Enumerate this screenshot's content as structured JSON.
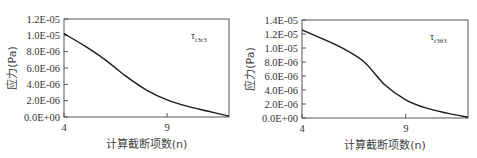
{
  "chart_data": [
    {
      "type": "line",
      "title": "",
      "legend_label": "τr3r3",
      "legend_symbol": "τ",
      "legend_subscript": "r3r3",
      "xlabel": "计算截断项数(n)",
      "ylabel": "应力(Pa)",
      "xlim": [
        4,
        12
      ],
      "ylim": [
        0,
        1.2e-05
      ],
      "x_ticks": [
        4,
        9
      ],
      "x_tick_labels": [
        "4",
        "9"
      ],
      "y_ticks": [
        0,
        2e-06,
        4e-06,
        6e-06,
        8e-06,
        1e-05,
        1.2e-05
      ],
      "y_tick_labels": [
        "0.0E+00",
        "2.0E-06",
        "4.0E-06",
        "6.0E-06",
        "8.0E-06",
        "1.0E-05",
        "1.2E-05"
      ],
      "grid": false,
      "legend_position": "upper right",
      "x": [
        4,
        5,
        6,
        7,
        8,
        9,
        10,
        11,
        12
      ],
      "series": [
        {
          "name": "τr3r3",
          "values": [
            1.02e-05,
            8.7e-06,
            7e-06,
            5e-06,
            3.3e-06,
            2.1e-06,
            1.3e-06,
            7e-07,
            1e-07
          ]
        }
      ]
    },
    {
      "type": "line",
      "title": "",
      "legend_label": "τr3θ3",
      "legend_symbol": "τ",
      "legend_subscript": "r3θ3",
      "xlabel": "计算截断项数(n)",
      "ylabel": "应力(Pa)",
      "xlim": [
        4,
        12
      ],
      "ylim": [
        0,
        1.4e-05
      ],
      "x_ticks": [
        4,
        9
      ],
      "x_tick_labels": [
        "4",
        "9"
      ],
      "y_ticks": [
        0,
        2e-06,
        4e-06,
        6e-06,
        8e-06,
        1e-05,
        1.2e-05,
        1.4e-05
      ],
      "y_tick_labels": [
        "0.0E+00",
        "2.0E-06",
        "4.0E-06",
        "6.0E-06",
        "8.0E-06",
        "1.0E-05",
        "1.2E-05",
        "1.4E-05"
      ],
      "grid": false,
      "legend_position": "upper right",
      "x": [
        4,
        5,
        6,
        7,
        8,
        9,
        10,
        11,
        12
      ],
      "series": [
        {
          "name": "τr3θ3",
          "values": [
            1.26e-05,
            1.13e-05,
            9.9e-06,
            8e-06,
            4.7e-06,
            2.6e-06,
            1.4e-06,
            7e-07,
            1e-07
          ]
        }
      ]
    }
  ],
  "colors": {
    "line": "#1a1a1a",
    "frame": "#555555",
    "text": "#333333"
  }
}
